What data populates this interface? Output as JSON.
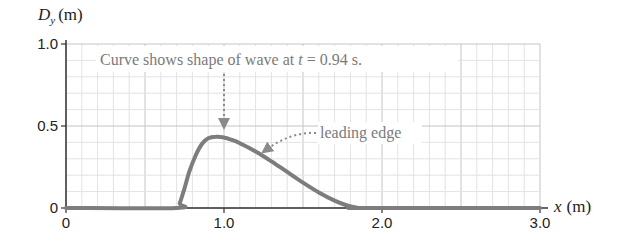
{
  "chart_data": {
    "type": "line",
    "title": "",
    "ylabel": "D_y (m)",
    "ylabel_main": "D",
    "ylabel_sub": "y",
    "ylabel_unit": "(m)",
    "xlabel": "x (m)",
    "xlabel_var": "x",
    "xlabel_unit": "(m)",
    "xlim": [
      0,
      3.0
    ],
    "ylim": [
      0,
      1.0
    ],
    "xticks": [
      0,
      1.0,
      2.0,
      3.0
    ],
    "xtick_labels": [
      "0",
      "1.0",
      "2.0",
      "3.0"
    ],
    "yticks": [
      0,
      0.5,
      1.0
    ],
    "ytick_labels": [
      "0",
      "0.5",
      "1.0"
    ],
    "grid": true,
    "grid_minor_step": 0.1,
    "series": [
      {
        "name": "wave shape at t = 0.94 s",
        "color": "#7d7d7d",
        "x": [
          0,
          0.7,
          0.72,
          0.75,
          0.78,
          0.82,
          0.86,
          0.9,
          0.95,
          1.0,
          1.05,
          1.1,
          1.2,
          1.3,
          1.4,
          1.5,
          1.6,
          1.7,
          1.78,
          1.84,
          1.88,
          3.0
        ],
        "y": [
          0,
          0,
          0.03,
          0.12,
          0.22,
          0.32,
          0.39,
          0.425,
          0.435,
          0.43,
          0.415,
          0.395,
          0.345,
          0.285,
          0.22,
          0.155,
          0.095,
          0.045,
          0.015,
          0.003,
          0,
          0
        ]
      }
    ],
    "annotations": [
      {
        "text_prefix": "Curve shows shape of wave at ",
        "text_var": "t",
        "text_suffix": " = 0.94 s.",
        "points_to_x": 0.95,
        "arrow": "dotted-down"
      },
      {
        "text": "leading edge",
        "points_to_x": 1.25,
        "arrow": "dotted-curved"
      }
    ]
  }
}
